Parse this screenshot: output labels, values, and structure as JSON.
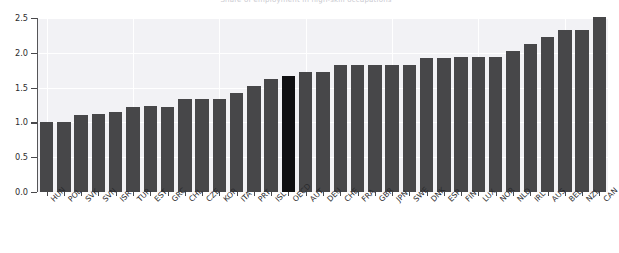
{
  "figure": {
    "title_clipped": "Share of employment in high-skill occupations",
    "background": "#f2f2f5",
    "bar_color": "#474749",
    "highlight_color": "#101012",
    "grid_color": "#ffffff"
  },
  "axes": {
    "y_ticks": [
      "0.0",
      "0.5",
      "1.0",
      "1.5",
      "2.0",
      "2.5"
    ],
    "y_tick_values": [
      0.0,
      0.5,
      1.0,
      1.5,
      2.0,
      2.5
    ],
    "ylim": [
      0.0,
      2.5
    ],
    "xlabel": "",
    "ylabel": ""
  },
  "chart_data": {
    "type": "bar",
    "title": "",
    "xlabel": "",
    "ylabel": "",
    "ylim": [
      0.0,
      2.5
    ],
    "grid": true,
    "legend": "none",
    "highlight_category": "OECD",
    "categories": [
      "HUN",
      "POL",
      "SVK",
      "SVN",
      "ISR",
      "TUR",
      "EST",
      "GRC",
      "CHL",
      "CZE",
      "KOR",
      "ITA",
      "PRT",
      "ISL",
      "OECD",
      "AUT",
      "DEU",
      "CHE",
      "FRA",
      "GBR",
      "JPN",
      "SWE",
      "DNK",
      "ESP",
      "FIN",
      "LUX",
      "NOR",
      "NLD",
      "IRL",
      "AUS",
      "BEL",
      "NZL",
      "CAN"
    ],
    "values": [
      1.0,
      1.01,
      1.11,
      1.12,
      1.15,
      1.22,
      1.23,
      1.22,
      1.33,
      1.33,
      1.33,
      1.42,
      1.52,
      1.62,
      1.66,
      1.72,
      1.72,
      1.83,
      1.83,
      1.83,
      1.83,
      1.83,
      1.93,
      1.93,
      1.94,
      1.94,
      1.94,
      2.02,
      2.13,
      2.23,
      2.33,
      2.33,
      2.52
    ]
  }
}
